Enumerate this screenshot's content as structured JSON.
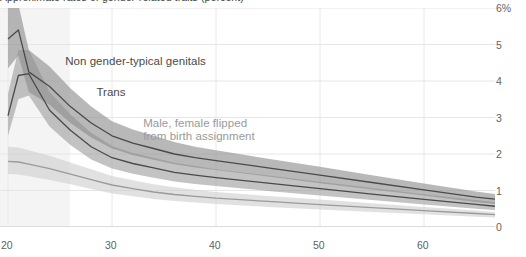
{
  "title": "Approximate rates of gender-related traits (percent)",
  "chart_data": {
    "type": "line",
    "title": "Approximate rates of gender-related traits (percent)",
    "xlabel": "",
    "ylabel": "",
    "xlim": [
      20,
      67.5
    ],
    "ylim": [
      0,
      6
    ],
    "grid": true,
    "legend": "inline annotations",
    "x_ticks": [
      "20",
      "30",
      "40",
      "50",
      "60"
    ],
    "x_tick_values": [
      20,
      30,
      40,
      50,
      60
    ],
    "y_ticks": [
      "0",
      "1",
      "2",
      "3",
      "4",
      "5",
      "6%"
    ],
    "y_tick_values": [
      0,
      1,
      2,
      3,
      4,
      5,
      6
    ],
    "x": [
      20,
      21,
      22,
      24,
      26,
      28,
      30,
      32,
      34,
      36,
      38,
      40,
      45,
      50,
      55,
      60,
      65,
      67.5
    ],
    "series": [
      {
        "name": "Non gender-typical genitals",
        "color": "#8c8c8c",
        "line_color": "#4a4a4a",
        "values": [
          5.15,
          5.4,
          4.25,
          3.85,
          3.3,
          2.85,
          2.5,
          2.3,
          2.15,
          2.0,
          1.9,
          1.82,
          1.62,
          1.42,
          1.22,
          1.02,
          0.82,
          0.74
        ],
        "band_low": [
          4.35,
          4.7,
          3.7,
          3.35,
          2.85,
          2.45,
          2.15,
          1.97,
          1.84,
          1.72,
          1.63,
          1.56,
          1.38,
          1.2,
          1.03,
          0.86,
          0.68,
          0.61
        ],
        "band_high": [
          6.0,
          6.1,
          4.85,
          4.4,
          3.8,
          3.3,
          2.9,
          2.67,
          2.5,
          2.33,
          2.2,
          2.1,
          1.87,
          1.65,
          1.42,
          1.19,
          0.97,
          0.88
        ]
      },
      {
        "name": "Trans",
        "color": "#9e9e9e",
        "line_color": "#4a4a4a",
        "values": [
          3.05,
          4.15,
          4.2,
          3.2,
          2.65,
          2.2,
          1.9,
          1.74,
          1.62,
          1.5,
          1.42,
          1.35,
          1.2,
          1.05,
          0.9,
          0.76,
          0.62,
          0.55
        ],
        "band_low": [
          2.5,
          3.5,
          3.6,
          2.75,
          2.25,
          1.85,
          1.6,
          1.46,
          1.35,
          1.25,
          1.18,
          1.12,
          0.99,
          0.86,
          0.74,
          0.62,
          0.5,
          0.44
        ],
        "band_high": [
          3.65,
          4.85,
          4.85,
          3.7,
          3.08,
          2.58,
          2.22,
          2.03,
          1.9,
          1.76,
          1.67,
          1.58,
          1.41,
          1.24,
          1.07,
          0.9,
          0.74,
          0.66
        ]
      },
      {
        "name": "Male, female flipped from birth assignment",
        "color": "#cfcfcf",
        "line_color": "#9a9a9a",
        "values": [
          1.8,
          1.78,
          1.72,
          1.6,
          1.45,
          1.3,
          1.15,
          1.05,
          0.96,
          0.89,
          0.84,
          0.79,
          0.7,
          0.61,
          0.53,
          0.45,
          0.37,
          0.33
        ],
        "band_low": [
          1.45,
          1.44,
          1.39,
          1.29,
          1.17,
          1.04,
          0.92,
          0.84,
          0.77,
          0.71,
          0.67,
          0.63,
          0.55,
          0.48,
          0.41,
          0.35,
          0.28,
          0.25
        ],
        "band_high": [
          2.2,
          2.18,
          2.1,
          1.95,
          1.77,
          1.58,
          1.4,
          1.28,
          1.17,
          1.09,
          1.02,
          0.96,
          0.85,
          0.75,
          0.65,
          0.55,
          0.45,
          0.4
        ]
      }
    ],
    "annotations": [
      {
        "text": "Non gender-typical genitals",
        "x": 25.5,
        "y": 4.55,
        "color": "#4a4a4a"
      },
      {
        "text": "Trans",
        "x": 28.5,
        "y": 3.7,
        "color": "#4a4a4a"
      },
      {
        "text": "Male, female flipped",
        "x": 33,
        "y": 2.85,
        "color": "#9a9a9a"
      },
      {
        "text": "from birth assignment",
        "x": 33,
        "y": 2.5,
        "color": "#9a9a9a"
      }
    ]
  },
  "y_axis": {
    "labels": [
      {
        "text": "6%",
        "value": 6
      },
      {
        "text": "5",
        "value": 5
      },
      {
        "text": "4",
        "value": 4
      },
      {
        "text": "3",
        "value": 3
      },
      {
        "text": "2",
        "value": 2
      },
      {
        "text": "1",
        "value": 1
      },
      {
        "text": "0",
        "value": 0
      }
    ]
  },
  "x_axis": {
    "labels": [
      {
        "text": "20",
        "value": 20
      },
      {
        "text": "30",
        "value": 30
      },
      {
        "text": "40",
        "value": 40
      },
      {
        "text": "50",
        "value": 50
      },
      {
        "text": "60",
        "value": 60
      }
    ]
  },
  "annotations": {
    "label1": "Non gender-typical genitals",
    "label2": "Trans",
    "label3_line1": "Male, female flipped",
    "label3_line2": "from birth assignment"
  }
}
